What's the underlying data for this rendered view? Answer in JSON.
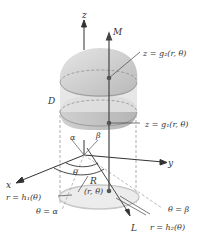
{
  "diagram": {
    "type": "cylindrical-coordinates-region",
    "labels": {
      "z_axis": "z",
      "x_axis": "x",
      "y_axis": "y",
      "M": "M",
      "L": "L",
      "D": "D",
      "R": "R",
      "point": "(r, θ)",
      "alpha": "α",
      "beta": "β",
      "theta": "θ",
      "upper_surface": "z = g₂(r, θ)",
      "lower_surface": "z = g₁(r, θ)",
      "inner_radius": "r = h₁(θ)",
      "outer_radius": "r = h₂(θ)",
      "theta_alpha": "θ = α",
      "theta_beta": "θ = β"
    },
    "colors": {
      "solid_fill": "#d9d9d9",
      "solid_shade": "#bdbdbd",
      "base_region": "#ececec",
      "line": "#333333",
      "dashed": "#9a9a9a",
      "point": "#555555"
    }
  }
}
